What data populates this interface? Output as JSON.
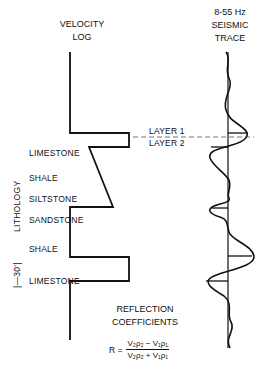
{
  "headers": {
    "velocity_log": [
      "VELOCITY",
      "LOG"
    ],
    "seismic_trace": [
      "8-55 Hz",
      "SEISMIC",
      "TRACE"
    ]
  },
  "lithology": {
    "axis_label": "LITHOLOGY",
    "scale_label": "|—30'|",
    "layers": [
      {
        "name": "LIMESTONE",
        "y": 154
      },
      {
        "name": "SHALE",
        "y": 179
      },
      {
        "name": "SILTSTONE",
        "y": 200
      },
      {
        "name": "SANDSTONE",
        "y": 221
      },
      {
        "name": "SHALE",
        "y": 250
      },
      {
        "name": "LIMESTONE",
        "y": 282
      }
    ]
  },
  "interface": {
    "layer1": "LAYER 1",
    "layer2": "LAYER 2"
  },
  "reflection": {
    "title": [
      "REFLECTION",
      "COEFFICIENTS"
    ],
    "formula_lhs": "R =",
    "numerator": "V₂ρ₂ − V₁ρ₁",
    "denominator": "V₂ρ₂ + V₁ρ₁"
  },
  "colors": {
    "ink": "#111111",
    "dash": "#666666",
    "background": "#ffffff"
  }
}
